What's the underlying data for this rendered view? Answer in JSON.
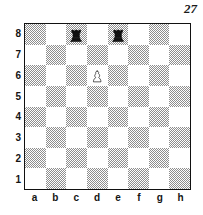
{
  "diagram": {
    "number": "27"
  },
  "board": {
    "files": [
      "a",
      "b",
      "c",
      "d",
      "e",
      "f",
      "g",
      "h"
    ],
    "ranks": [
      "8",
      "7",
      "6",
      "5",
      "4",
      "3",
      "2",
      "1"
    ],
    "orientation": "white-bottom",
    "colors": {
      "light_square": "#ffffff",
      "dark_square": "#8e8e8e",
      "border": "#111111",
      "label": "#141414"
    },
    "pieces": [
      {
        "square": "c8",
        "color": "black",
        "type": "rook",
        "glyph": "black-rook-icon"
      },
      {
        "square": "e8",
        "color": "black",
        "type": "rook",
        "glyph": "black-rook-icon"
      },
      {
        "square": "d6",
        "color": "white",
        "type": "pawn",
        "glyph": "white-pawn-icon"
      }
    ],
    "position_fen": "2r1r3/8/3P4/8/8/8/8/8"
  }
}
